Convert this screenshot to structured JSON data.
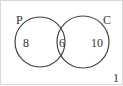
{
  "diagram": {
    "type": "venn",
    "sets": [
      {
        "label": "P",
        "only_value": "8"
      },
      {
        "label": "C",
        "only_value": "10"
      }
    ],
    "intersection_value": "6",
    "outside_value": "1",
    "colors": {
      "stroke": "#444444",
      "border": "#d8d8d8",
      "text": "#333333"
    }
  }
}
